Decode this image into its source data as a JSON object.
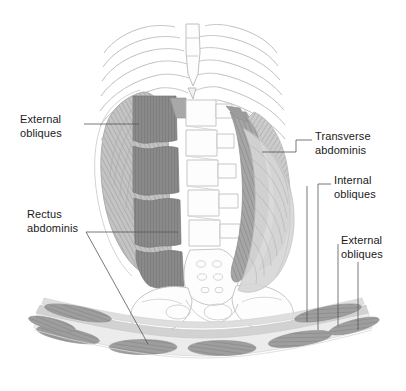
{
  "figure": {
    "view_top": "anterior abdominal wall",
    "view_bottom": "transverse cross-section"
  },
  "labels": {
    "external_obliques_left": "External\nobliques",
    "rectus_abdominis": "Rectus\nabdominis",
    "transverse_abdominis": "Transverse\nabdominis",
    "internal_obliques": "Internal\nobliques",
    "external_obliques_right": "External\nobliques"
  },
  "colors": {
    "background": "#ffffff",
    "outline": "#b4b4b4",
    "outline_dark": "#8c8c8c",
    "leader_line": "#555555",
    "text": "#1a1a1a",
    "rectus_muscle": "#8a8a8a",
    "oblique_light": "#c9c9c9",
    "oblique_mid": "#b0b0b0",
    "oblique_dark": "#9a9a9a",
    "section_layer_light": "#dcdcdc",
    "section_layer_mid": "#c4c4c4",
    "section_muscle": "#9e9e9e",
    "bone_fill": "#fdfdfd"
  }
}
